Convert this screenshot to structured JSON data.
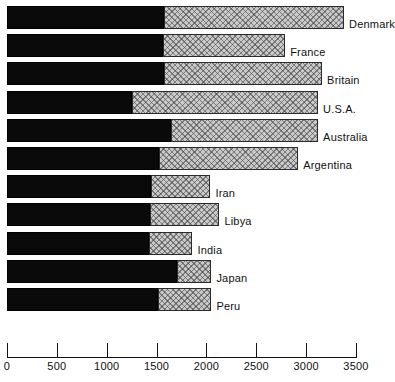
{
  "chart_data": {
    "type": "bar",
    "orientation": "horizontal",
    "stacked": true,
    "title": "",
    "subtitle": "",
    "xlabel": "",
    "ylabel": "",
    "xlim": [
      0,
      3500
    ],
    "grid": false,
    "legend": "none",
    "axis": {
      "ticks": [
        0,
        500,
        1000,
        1500,
        2000,
        2500,
        3000,
        3500
      ],
      "tick_labels": [
        "0",
        "500",
        "1000",
        "1500",
        "2000",
        "2500",
        "3000",
        "3500"
      ],
      "min": 0,
      "max": 3500
    },
    "categories": [
      "Denmark",
      "France",
      "Britain",
      "U.S.A.",
      "Australia",
      "Argentina",
      "Iran",
      "Libya",
      "India",
      "Japan",
      "Peru"
    ],
    "series": [
      {
        "name": "dark-segment",
        "fill": "solid-black",
        "color": "#0a0a0a",
        "values": [
          1570,
          1560,
          1570,
          1250,
          1640,
          1520,
          1440,
          1430,
          1420,
          1700,
          1510
        ]
      },
      {
        "name": "hatched-segment",
        "fill": "cross-hatch",
        "color": "#c9c9c9",
        "values": [
          1810,
          1230,
          1590,
          1870,
          1480,
          1400,
          600,
          700,
          440,
          350,
          540
        ]
      }
    ],
    "totals": [
      3380,
      2790,
      3160,
      3120,
      3120,
      2920,
      2040,
      2130,
      1860,
      2050,
      2050
    ],
    "bars": [
      {
        "label": "Denmark",
        "dark": 1570,
        "hatched": 1810,
        "total": 3380
      },
      {
        "label": "France",
        "dark": 1560,
        "hatched": 1230,
        "total": 2790
      },
      {
        "label": "Britain",
        "dark": 1570,
        "hatched": 1590,
        "total": 3160
      },
      {
        "label": "U.S.A.",
        "dark": 1250,
        "hatched": 1870,
        "total": 3120
      },
      {
        "label": "Australia",
        "dark": 1640,
        "hatched": 1480,
        "total": 3120
      },
      {
        "label": "Argentina",
        "dark": 1520,
        "hatched": 1400,
        "total": 2920
      },
      {
        "label": "Iran",
        "dark": 1440,
        "hatched": 600,
        "total": 2040
      },
      {
        "label": "Libya",
        "dark": 1430,
        "hatched": 700,
        "total": 2130
      },
      {
        "label": "India",
        "dark": 1420,
        "hatched": 440,
        "total": 1860
      },
      {
        "label": "Japan",
        "dark": 1700,
        "hatched": 350,
        "total": 2050
      },
      {
        "label": "Peru",
        "dark": 1510,
        "hatched": 540,
        "total": 2050
      }
    ]
  },
  "colors": {
    "dark_segment": "#0a0a0a",
    "hatched_segment": "#c9c9c9",
    "axis": "#111111",
    "background": "#ffffff"
  }
}
